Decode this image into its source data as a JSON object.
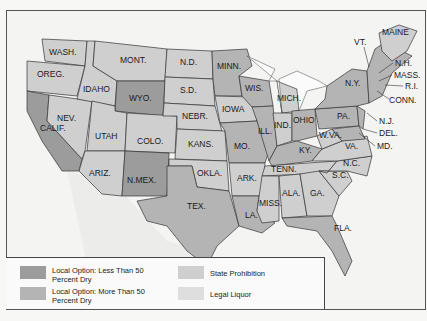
{
  "colors": {
    "less_than_50_dry": "#9c9c9c",
    "more_than_50_dry": "#b4b4b4",
    "state_prohibition": "#cfcfcf",
    "legal_liquor": "#dedede",
    "outside": "#f4f4f2",
    "water": "#fbfbfb"
  },
  "legend": {
    "items": [
      {
        "label": "Local Option: Less Than 50 Percent Dry",
        "color_key": "less_than_50_dry"
      },
      {
        "label": "Local Option: More Than 50 Percent Dry",
        "color_key": "more_than_50_dry"
      },
      {
        "label": "State Prohibition",
        "color_key": "state_prohibition"
      },
      {
        "label": "Legal Liquor",
        "color_key": "legal_liquor"
      }
    ]
  },
  "states": [
    {
      "abbr": "WASH.",
      "category": "state_prohibition"
    },
    {
      "abbr": "OREG.",
      "category": "state_prohibition"
    },
    {
      "abbr": "CALIF.",
      "category": "less_than_50_dry"
    },
    {
      "abbr": "NEV.",
      "category": "state_prohibition"
    },
    {
      "abbr": "IDAHO",
      "category": "state_prohibition"
    },
    {
      "abbr": "MONT.",
      "category": "state_prohibition"
    },
    {
      "abbr": "WYO.",
      "category": "less_than_50_dry"
    },
    {
      "abbr": "UTAH",
      "category": "state_prohibition"
    },
    {
      "abbr": "COLO.",
      "category": "state_prohibition"
    },
    {
      "abbr": "ARIZ.",
      "category": "state_prohibition"
    },
    {
      "abbr": "N.MEX.",
      "category": "less_than_50_dry"
    },
    {
      "abbr": "N.D.",
      "category": "state_prohibition"
    },
    {
      "abbr": "S.D.",
      "category": "state_prohibition"
    },
    {
      "abbr": "NEBR.",
      "category": "state_prohibition"
    },
    {
      "abbr": "KANS.",
      "category": "state_prohibition"
    },
    {
      "abbr": "OKLA.",
      "category": "state_prohibition"
    },
    {
      "abbr": "TEX.",
      "category": "more_than_50_dry"
    },
    {
      "abbr": "MINN.",
      "category": "more_than_50_dry"
    },
    {
      "abbr": "IOWA",
      "category": "state_prohibition"
    },
    {
      "abbr": "MO.",
      "category": "more_than_50_dry"
    },
    {
      "abbr": "ARK.",
      "category": "state_prohibition"
    },
    {
      "abbr": "LA.",
      "category": "more_than_50_dry"
    },
    {
      "abbr": "WIS.",
      "category": "more_than_50_dry"
    },
    {
      "abbr": "ILL.",
      "category": "more_than_50_dry"
    },
    {
      "abbr": "MICH.",
      "category": "state_prohibition"
    },
    {
      "abbr": "IND.",
      "category": "state_prohibition"
    },
    {
      "abbr": "OHIO",
      "category": "more_than_50_dry"
    },
    {
      "abbr": "KY.",
      "category": "more_than_50_dry"
    },
    {
      "abbr": "TENN.",
      "category": "state_prohibition"
    },
    {
      "abbr": "MISS.",
      "category": "state_prohibition"
    },
    {
      "abbr": "ALA.",
      "category": "state_prohibition"
    },
    {
      "abbr": "GA.",
      "category": "state_prohibition"
    },
    {
      "abbr": "FLA.",
      "category": "more_than_50_dry"
    },
    {
      "abbr": "S.C.",
      "category": "state_prohibition"
    },
    {
      "abbr": "N.C.",
      "category": "state_prohibition"
    },
    {
      "abbr": "VA.",
      "category": "state_prohibition"
    },
    {
      "abbr": "W.VA.",
      "category": "state_prohibition"
    },
    {
      "abbr": "MD.",
      "category": "more_than_50_dry"
    },
    {
      "abbr": "DEL.",
      "category": "more_than_50_dry"
    },
    {
      "abbr": "PA.",
      "category": "more_than_50_dry"
    },
    {
      "abbr": "N.J.",
      "category": "more_than_50_dry"
    },
    {
      "abbr": "N.Y.",
      "category": "more_than_50_dry"
    },
    {
      "abbr": "CONN.",
      "category": "more_than_50_dry"
    },
    {
      "abbr": "R.I.",
      "category": "more_than_50_dry"
    },
    {
      "abbr": "MASS.",
      "category": "more_than_50_dry"
    },
    {
      "abbr": "VT.",
      "category": "more_than_50_dry"
    },
    {
      "abbr": "N.H.",
      "category": "more_than_50_dry"
    },
    {
      "abbr": "MAINE",
      "category": "state_prohibition"
    }
  ]
}
